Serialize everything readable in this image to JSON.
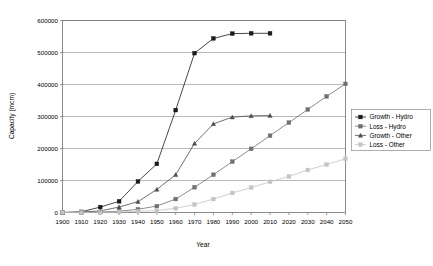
{
  "chart_data": {
    "type": "line",
    "title": "",
    "xlabel": "Year",
    "ylabel": "Capacity (mcm)",
    "xlim": [
      1900,
      2050
    ],
    "ylim": [
      0,
      600000
    ],
    "grid": true,
    "legend_position": "right",
    "x_ticks": [
      "1900",
      "1910",
      "1920",
      "1930",
      "1940",
      "1950",
      "1960",
      "1970",
      "1980",
      "1990",
      "2000",
      "2010",
      "2020",
      "2030",
      "2040",
      "2050"
    ],
    "y_ticks": [
      "0",
      "100000",
      "200000",
      "300000",
      "400000",
      "500000",
      "600000"
    ],
    "x": [
      1900,
      1910,
      1920,
      1930,
      1940,
      1950,
      1960,
      1970,
      1980,
      1990,
      2000,
      2010,
      2020,
      2030,
      2040,
      2050
    ],
    "series": [
      {
        "name": "Growth - Hydro",
        "color": "#1a1a1a",
        "marker": "square",
        "x": [
          1900,
          1910,
          1920,
          1930,
          1940,
          1950,
          1960,
          1970,
          1980,
          1990,
          2000,
          2010
        ],
        "values": [
          0,
          2000,
          17000,
          35000,
          97000,
          152000,
          320000,
          498000,
          544000,
          559000,
          560000,
          560000
        ]
      },
      {
        "name": "Loss - Hydro",
        "color": "#707070",
        "marker": "square",
        "x": [
          1900,
          1910,
          1920,
          1930,
          1940,
          1950,
          1960,
          1970,
          1980,
          1990,
          2000,
          2010,
          2020,
          2030,
          2040,
          2050
        ],
        "values": [
          0,
          500,
          1500,
          4000,
          10000,
          20000,
          42000,
          79000,
          118000,
          159000,
          199000,
          240000,
          281000,
          322000,
          363000,
          402000
        ]
      },
      {
        "name": "Growth - Other",
        "color": "#4d4d4d",
        "marker": "triangle",
        "x": [
          1900,
          1910,
          1920,
          1930,
          1940,
          1950,
          1960,
          1970,
          1980,
          1990,
          2000,
          2010
        ],
        "values": [
          0,
          1000,
          5000,
          17000,
          34000,
          72000,
          118000,
          216000,
          277000,
          298000,
          302000,
          303000
        ]
      },
      {
        "name": "Loss - Other",
        "color": "#c4c4c4",
        "marker": "square",
        "x": [
          1900,
          1910,
          1920,
          1930,
          1940,
          1950,
          1960,
          1970,
          1980,
          1990,
          2000,
          2010,
          2020,
          2030,
          2040,
          2050
        ],
        "values": [
          0,
          0,
          500,
          1500,
          4000,
          6000,
          13000,
          25000,
          42000,
          61000,
          78000,
          96000,
          113000,
          133000,
          150000,
          168000
        ]
      }
    ]
  },
  "legend": {
    "items": [
      {
        "label": "Growth - Hydro"
      },
      {
        "label": "Loss - Hydro"
      },
      {
        "label": "Growth - Other"
      },
      {
        "label": "Loss - Other"
      }
    ]
  }
}
